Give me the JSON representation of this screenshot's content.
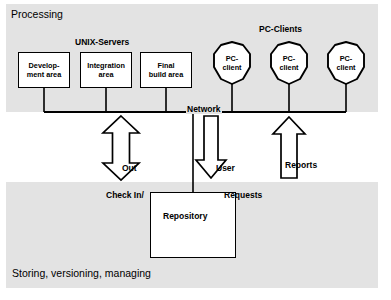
{
  "diagram": {
    "bands": {
      "top_label": "Processing",
      "bottom_label": "Storing, versioning, managing",
      "band_color": "#e3e3e3"
    },
    "groups": {
      "servers_label": "UNIX-Servers",
      "clients_label": "PC-Clients"
    },
    "network": {
      "label": "Network"
    },
    "server_nodes": [
      {
        "id": "development",
        "line1": "Develop-",
        "line2": "ment area"
      },
      {
        "id": "integration",
        "line1": "Integration",
        "line2": "area"
      },
      {
        "id": "finalbuild",
        "line1": "Final",
        "line2": "build area"
      }
    ],
    "client_nodes": [
      {
        "id": "pc-client-1",
        "line1": "PC-",
        "line2": "client"
      },
      {
        "id": "pc-client-2",
        "line1": "PC-",
        "line2": "client"
      },
      {
        "id": "pc-client-3",
        "line1": "PC-",
        "line2": "client"
      }
    ],
    "repository": {
      "label": "Repository"
    },
    "flows": [
      {
        "id": "check-in-out",
        "direction": "bidirectional",
        "line1": "Out",
        "line2": "Check In/"
      },
      {
        "id": "user-requests",
        "direction": "down",
        "line1": "User",
        "line2": "Requests"
      },
      {
        "id": "reports",
        "direction": "up",
        "line1": "Reports",
        "line2": ""
      }
    ],
    "colors": {
      "ink": "#000000",
      "band": "#e3e3e3",
      "node_fill": "#ffffff"
    }
  }
}
